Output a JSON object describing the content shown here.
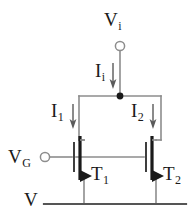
{
  "figure": {
    "background_color": "#ffffff",
    "line_color": "#6e6e6e",
    "device_color": "#1a1a1a",
    "text_color": "#1a1a1a"
  },
  "labels": {
    "input_voltage": {
      "base": "V",
      "sub": "i"
    },
    "input_current": {
      "base": "I",
      "sub": "i"
    },
    "current_left": {
      "base": "I",
      "sub": "1"
    },
    "current_right": {
      "base": "I",
      "sub": "2"
    },
    "gate_voltage": {
      "base": "V",
      "sub": "G"
    },
    "transistor_left": {
      "base": "T",
      "sub": "1"
    },
    "transistor_right": {
      "base": "T",
      "sub": "2"
    },
    "supply_rail": {
      "base": "V",
      "sub": ""
    }
  },
  "terminals": [
    {
      "name": "vi-terminal",
      "type": "open-circle",
      "x": 120,
      "y": 45
    },
    {
      "name": "vg-terminal",
      "type": "open-circle",
      "x": 44,
      "y": 157
    }
  ],
  "nodes": [
    {
      "name": "input-junction",
      "type": "solid-dot",
      "x": 120,
      "y": 96
    }
  ],
  "current_arrows": [
    {
      "name": "ii-arrow",
      "direction": "down",
      "x": 113,
      "y": 66,
      "length": 22
    },
    {
      "name": "i1-arrow",
      "direction": "down",
      "x": 73,
      "y": 106,
      "length": 22
    },
    {
      "name": "i2-arrow",
      "direction": "down",
      "x": 153,
      "y": 106,
      "length": 22
    }
  ],
  "transistors": [
    {
      "name": "mosfet-t1",
      "channel_x": 80,
      "top_y": 138,
      "bottom_y": 180,
      "gate_x": 72,
      "source_arrow": "right"
    },
    {
      "name": "mosfet-t2",
      "channel_x": 152,
      "top_y": 138,
      "bottom_y": 180,
      "gate_x": 144,
      "source_arrow": "right"
    }
  ]
}
